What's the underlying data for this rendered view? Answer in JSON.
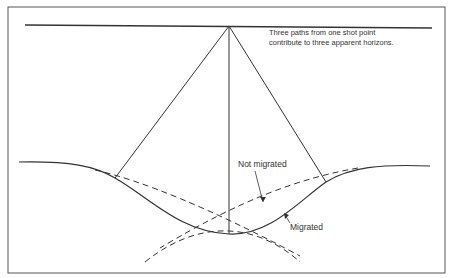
{
  "caption": "Three paths from one shot point contribute to three apparent horizons.",
  "labels": {
    "not_migrated": "Not migrated",
    "migrated": "Migrated"
  },
  "colors": {
    "line": "#333333",
    "frame": "#555555",
    "background": "#ffffff"
  }
}
